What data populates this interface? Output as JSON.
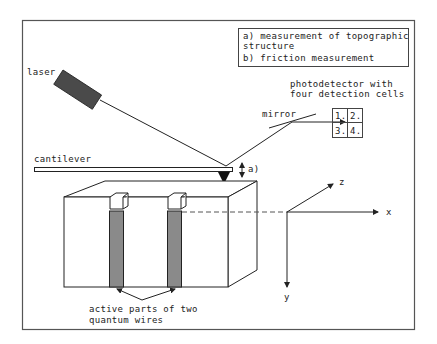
{
  "legend": {
    "line1": "a) measurement of topographic",
    "line2": "structure",
    "line3": "b) friction measurement"
  },
  "labels": {
    "laser": "laser",
    "photodetector_line1": "photodetector with",
    "photodetector_line2": "four detection cells",
    "mirror": "mirror",
    "cantilever": "cantilever",
    "a_marker": "a)",
    "b_marker": "b)",
    "wires_line1": "active parts of two",
    "wires_line2": "quantum wires"
  },
  "detector_cells": [
    "1.",
    "2.",
    "3.",
    "4."
  ],
  "axes": {
    "x": "x",
    "y": "y",
    "z": "z"
  },
  "colors": {
    "line": "#222222",
    "laser_body": "#4a4a4a",
    "wire_fill": "#8a8a8a",
    "frame": "#555555"
  }
}
